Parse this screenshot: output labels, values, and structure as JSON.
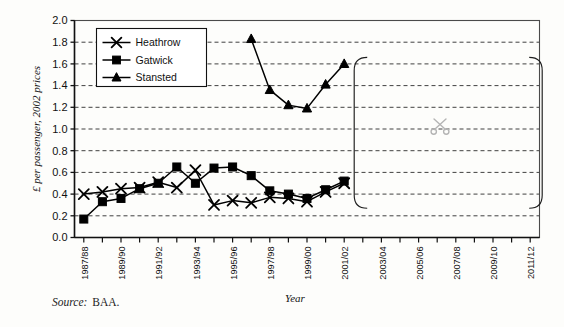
{
  "figure": {
    "source_label": "Source:",
    "source_value": "BAA."
  },
  "chart_data": {
    "type": "line",
    "title": "",
    "xlabel": "Year",
    "ylabel": "£ per passenger, 2002 prices",
    "ylim": [
      0.0,
      2.0
    ],
    "ytick_step": 0.2,
    "ytick_labels": [
      "0.0",
      "0.2",
      "0.4",
      "0.6",
      "0.8",
      "1.0",
      "1.2",
      "1.4",
      "1.6",
      "1.8",
      "2.0"
    ],
    "grid": "horizontal-dashed",
    "legend_position": "top-left",
    "categories": [
      "1987/88",
      "1988/89",
      "1989/90",
      "1990/91",
      "1991/92",
      "1992/93",
      "1993/94",
      "1994/95",
      "1995/96",
      "1996/97",
      "1997/98",
      "1998/99",
      "1999/00",
      "2000/01",
      "2001/02",
      "2002/03",
      "2003/04",
      "2004/05",
      "2005/06",
      "2006/07",
      "2007/08",
      "2008/09",
      "2009/10",
      "2010/11",
      "2011/12"
    ],
    "xtick_labels": [
      "1987/88",
      "1989/90",
      "1991/92",
      "1993/94",
      "1995/96",
      "1997/98",
      "1999/00",
      "2001/02",
      "2003/04",
      "2005/06",
      "2007/08",
      "2009/10",
      "2011/12"
    ],
    "series": [
      {
        "name": "Heathrow",
        "marker": "x",
        "color": "#000000",
        "x": [
          "1987/88",
          "1988/89",
          "1989/90",
          "1990/91",
          "1991/92",
          "1992/93",
          "1993/94",
          "1994/95",
          "1995/96",
          "1996/97",
          "1997/98",
          "1998/99",
          "1999/00",
          "2000/01",
          "2001/02"
        ],
        "values": [
          0.4,
          0.42,
          0.45,
          0.46,
          0.51,
          0.46,
          0.62,
          0.3,
          0.34,
          0.32,
          0.37,
          0.36,
          0.33,
          0.42,
          0.5
        ]
      },
      {
        "name": "Gatwick",
        "marker": "square",
        "color": "#000000",
        "x": [
          "1987/88",
          "1988/89",
          "1989/90",
          "1990/91",
          "1991/92",
          "1992/93",
          "1993/94",
          "1994/95",
          "1995/96",
          "1996/97",
          "1997/98",
          "1998/99",
          "1999/00",
          "2000/01",
          "2001/02"
        ],
        "values": [
          0.17,
          0.33,
          0.36,
          0.45,
          0.5,
          0.65,
          0.5,
          0.64,
          0.65,
          0.57,
          0.43,
          0.4,
          0.36,
          0.44,
          0.52
        ]
      },
      {
        "name": "Stansted",
        "marker": "triangle",
        "color": "#000000",
        "x": [
          "1996/97",
          "1997/98",
          "1998/99",
          "1999/00",
          "2000/01",
          "2001/02"
        ],
        "values": [
          1.83,
          1.36,
          1.22,
          1.19,
          1.41,
          1.6
        ]
      }
    ],
    "annotations": [
      {
        "name": "forecast-brace",
        "type": "brace",
        "from": "2001/02",
        "to": "2011/12"
      },
      {
        "name": "scissors-watermark",
        "type": "icon",
        "icon": "scissors-icon",
        "color": "#b4b4b4"
      }
    ]
  },
  "legend": {
    "items": [
      {
        "label": "Heathrow",
        "marker": "x"
      },
      {
        "label": "Gatwick",
        "marker": "square"
      },
      {
        "label": "Stansted",
        "marker": "triangle"
      }
    ]
  }
}
